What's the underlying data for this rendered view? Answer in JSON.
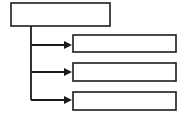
{
  "diagram": {
    "type": "flowchart",
    "title": "",
    "canvas": {
      "width": 185,
      "height": 120
    },
    "colors": {
      "background": "#ffffff",
      "box_fill": "#ffffff",
      "line": "#1c1c1c",
      "arrow": "#1c1c1c"
    },
    "parent": {
      "id": "parent-box",
      "label": "",
      "x": 11,
      "y": 3,
      "width": 99,
      "height": 23
    },
    "trunk": {
      "id": "trunk-line",
      "x": 31,
      "y_start": 26,
      "y_end": 100
    },
    "children": [
      {
        "id": "child-box-1",
        "label": "",
        "x": 73,
        "y": 35,
        "width": 103,
        "height": 17,
        "branch_y": 45
      },
      {
        "id": "child-box-2",
        "label": "",
        "x": 73,
        "y": 63,
        "width": 103,
        "height": 18,
        "branch_y": 72
      },
      {
        "id": "child-box-3",
        "label": "",
        "x": 73,
        "y": 92,
        "width": 103,
        "height": 18,
        "branch_y": 100
      }
    ],
    "arrow": {
      "tip_x": 72,
      "tail_x": 31,
      "head_length": 8,
      "head_width": 8
    }
  }
}
